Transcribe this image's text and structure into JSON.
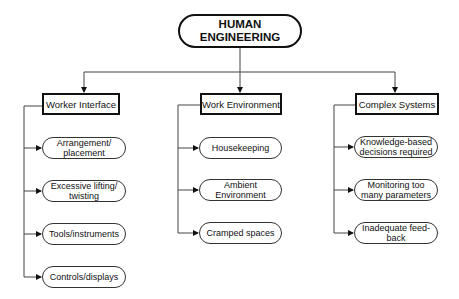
{
  "diagram": {
    "root": {
      "line1": "HUMAN",
      "line2": "ENGINEERING"
    },
    "categories": [
      {
        "label": "Worker Interface",
        "items": [
          {
            "line1": "Arrangement/",
            "line2": "placement"
          },
          {
            "line1": "Excessive lifting/",
            "line2": "twisting"
          },
          {
            "line1": "Tools/instruments",
            "line2": ""
          },
          {
            "line1": "Controls/displays",
            "line2": ""
          }
        ]
      },
      {
        "label": "Work Environment",
        "items": [
          {
            "line1": "Housekeeping",
            "line2": ""
          },
          {
            "line1": "Ambient",
            "line2": "Environment"
          },
          {
            "line1": "Cramped spaces",
            "line2": ""
          }
        ]
      },
      {
        "label": "Complex Systems",
        "items": [
          {
            "line1": "Knowledge-based",
            "line2": "decisions required"
          },
          {
            "line1": "Monitoring too",
            "line2": "many parameters"
          },
          {
            "line1": "Inadequate feed-",
            "line2": "back"
          }
        ]
      }
    ],
    "colors": {
      "stroke": "#111111",
      "background": "#ffffff"
    }
  }
}
